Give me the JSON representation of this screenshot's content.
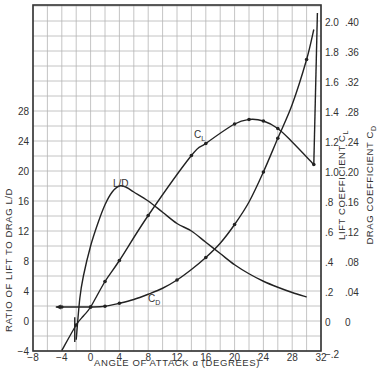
{
  "chart_data": {
    "type": "line",
    "title": "",
    "xlabel": "ANGLE OF ATTACK α (DEGREES)",
    "ylabel": "RATIO OF LIFT TO DRAG L/D",
    "ylabel_right_1": "LIFT COEFFICIENT C_L",
    "ylabel_right_2": "DRAG COEFFICIENT C_D",
    "xlim": [
      -8,
      32
    ],
    "ylim_left": [
      -4,
      42
    ],
    "ylim_right_cl": [
      -0.2,
      2.1
    ],
    "ylim_right_cd": [
      -0.04,
      0.42
    ],
    "grid": true,
    "x_ticks": [
      "-8",
      "-4",
      "0",
      "4",
      "8",
      "12",
      "16",
      "20",
      "24",
      "28",
      "32"
    ],
    "y_ticks_left": [
      "-4",
      "0",
      "4",
      "8",
      "12",
      "16",
      "20",
      "24",
      "28"
    ],
    "y_ticks_cl": [
      "-.2",
      "0",
      ".2",
      ".4",
      ".6",
      ".8",
      "1.0",
      "1.2",
      "1.4",
      "1.6",
      "1.8",
      "2.0"
    ],
    "y_ticks_cd": [
      "0",
      ".04",
      ".08",
      ".12",
      ".16",
      ".20",
      ".24",
      ".28",
      ".32",
      ".36",
      ".40"
    ],
    "series": [
      {
        "name": "L/D",
        "axis": "left",
        "x": [
          -2,
          -1.5,
          -1,
          0,
          1,
          2,
          3,
          4,
          5,
          6,
          8,
          10,
          12,
          14,
          16,
          18,
          20,
          22,
          24,
          26,
          28,
          30
        ],
        "values": [
          -2.5,
          3,
          6,
          10,
          13,
          15.5,
          17.2,
          18,
          17.8,
          17.2,
          16,
          14.5,
          13,
          12,
          10.5,
          9,
          7.5,
          6.3,
          5.3,
          4.5,
          3.8,
          3.2
        ]
      },
      {
        "name": "C_L",
        "axis": "right_cl",
        "x": [
          -4,
          -2,
          -1,
          0,
          2,
          4,
          8,
          14,
          16,
          20,
          22,
          24,
          26,
          28,
          31
        ],
        "values": [
          -0.19,
          -0.02,
          0.04,
          0.1,
          0.27,
          0.41,
          0.71,
          1.11,
          1.19,
          1.32,
          1.35,
          1.34,
          1.29,
          1.2,
          1.05
        ],
        "markers_at": [
          -2,
          0,
          2,
          4,
          8,
          14,
          16,
          20,
          22,
          24,
          26,
          31
        ]
      },
      {
        "name": "C_D",
        "axis": "right_cd",
        "x": [
          -4,
          -2,
          0,
          2,
          4,
          6,
          8,
          10,
          12,
          14,
          16,
          18,
          20,
          22,
          24,
          26,
          28,
          30,
          31
        ],
        "values": [
          0.02,
          0.02,
          0.02,
          0.021,
          0.025,
          0.03,
          0.037,
          0.045,
          0.056,
          0.07,
          0.086,
          0.105,
          0.13,
          0.16,
          0.2,
          0.245,
          0.29,
          0.35,
          0.39
        ],
        "markers_at": [
          -4,
          0,
          2,
          4,
          12,
          16,
          20,
          24,
          26,
          30
        ]
      }
    ],
    "annotations": [
      {
        "text": "L/D",
        "x": 4,
        "y_left": 18.5
      },
      {
        "text": "C_L",
        "x": 16,
        "y_cl": 1.25
      },
      {
        "text": "C_D",
        "x": 10,
        "y_cd": 0.045
      }
    ]
  },
  "labels": {
    "x_axis": "ANGLE OF ATTACK α (DEGREES)",
    "y_left": "RATIO OF LIFT TO DRAG L/D",
    "y_right_cl": "LIFT COEFFICIENT C",
    "y_right_cl_sub": "L",
    "y_right_cd": "DRAG COEFFICIENT C",
    "y_right_cd_sub": "D",
    "curve_ld": "L/D",
    "curve_cl": "C",
    "curve_cl_sub": "L",
    "curve_cd": "C",
    "curve_cd_sub": "D"
  }
}
